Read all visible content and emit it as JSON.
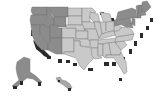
{
  "map": {
    "title": "",
    "type": "choropleth",
    "style": "grayscale 3D extruded",
    "colors": {
      "west_region": "#8c8c8c",
      "central_region": "#c9c9c9",
      "northeast_region": "#8c8c8c",
      "southeast_region": "#c9c9c9",
      "extrusion_shadow": "#2a2a2a",
      "borders": "#6a6a6a",
      "background": "#ffffff"
    },
    "regions": [
      {
        "name": "west",
        "shade": "dark",
        "states": [
          "WA",
          "OR",
          "CA",
          "NV",
          "ID",
          "MT",
          "WY",
          "UT",
          "AZ"
        ]
      },
      {
        "name": "central",
        "shade": "light",
        "states": [
          "CO",
          "NM",
          "ND",
          "SD",
          "NE",
          "KS",
          "OK",
          "TX",
          "MN",
          "IA",
          "MO",
          "AR",
          "LA",
          "WI",
          "IL",
          "MI",
          "IN",
          "OH",
          "KY",
          "TN",
          "MS",
          "AL"
        ]
      },
      {
        "name": "southeast",
        "shade": "light",
        "states": [
          "GA",
          "FL",
          "SC",
          "NC",
          "VA",
          "WV"
        ]
      },
      {
        "name": "northeast",
        "shade": "dark",
        "states": [
          "PA",
          "NY",
          "NJ",
          "CT",
          "RI",
          "MA",
          "VT",
          "NH",
          "ME",
          "MD",
          "DE"
        ]
      },
      {
        "name": "alaska",
        "shade": "dark",
        "states": [
          "AK"
        ]
      },
      {
        "name": "hawaii",
        "shade": "mid",
        "states": [
          "HI"
        ]
      }
    ]
  }
}
